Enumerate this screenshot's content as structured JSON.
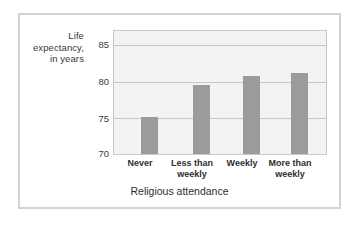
{
  "chart_data": {
    "type": "bar",
    "title": "",
    "categories": [
      "Never",
      "Less than weekly",
      "Weekly",
      "More than weekly"
    ],
    "category_lines": [
      [
        "Never"
      ],
      [
        "Less than",
        "weekly"
      ],
      [
        "Weekly"
      ],
      [
        "More than",
        "weekly"
      ]
    ],
    "values": [
      75.1,
      79.6,
      80.8,
      81.2
    ],
    "xlabel": "Religious attendance",
    "ylabel": "Life expectancy, in years",
    "ylabel_lines": [
      "Life",
      "expectancy,",
      "in years"
    ],
    "ylim": [
      70,
      87
    ],
    "yticks": [
      70,
      75,
      80,
      85
    ],
    "ytick_labels": [
      "70",
      "75",
      "80",
      "85"
    ],
    "grid": true,
    "grid_orientation": "horizontal",
    "legend": false,
    "bar_color": "#9b9b9b",
    "plot_background": "#f3f3f3",
    "gridline_color": "#c6c6c6",
    "frame_color": "#d3d3d3"
  }
}
